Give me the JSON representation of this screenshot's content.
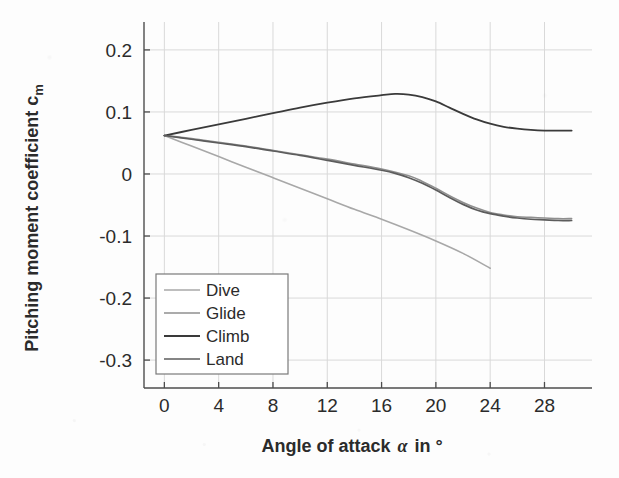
{
  "chart_data": {
    "type": "line",
    "title": "",
    "xlabel": "Angle of attack α in °",
    "ylabel": "Pitching moment coefficient c",
    "ylabel_sub": "m",
    "xlabel_main": "Angle of attack",
    "xlabel_symbol": "α",
    "xlabel_unit": "in °",
    "xlim": [
      -1.5,
      31.5
    ],
    "ylim": [
      -0.345,
      0.245
    ],
    "xticks": [
      0,
      4,
      8,
      12,
      16,
      20,
      24,
      28
    ],
    "xticklabels": [
      "0",
      "4",
      "8",
      "12",
      "16",
      "20",
      "24",
      "28"
    ],
    "yticks": [
      0.2,
      0.1,
      0,
      -0.1,
      -0.2,
      -0.3
    ],
    "yticklabels": [
      "0.2",
      "0.1",
      "0",
      "-0.1",
      "-0.2",
      "-0.3"
    ],
    "grid": true,
    "grid_color": "#d9d9d9",
    "axis_color": "#4d4d4d",
    "legend_position": "lower-left",
    "series": [
      {
        "name": "Dive",
        "color": "#a8a8a8",
        "width": 1.6,
        "x": [
          0,
          2,
          4,
          6,
          8,
          10,
          12,
          14,
          16,
          18,
          20,
          22,
          24
        ],
        "y": [
          0.062,
          0.045,
          0.028,
          0.011,
          -0.006,
          -0.023,
          -0.04,
          -0.057,
          -0.073,
          -0.09,
          -0.108,
          -0.128,
          -0.152
        ]
      },
      {
        "name": "Glide",
        "color": "#8f8f8f",
        "width": 1.6,
        "x": [
          0,
          2,
          4,
          6,
          8,
          10,
          12,
          14,
          16,
          18,
          19,
          20,
          21,
          22,
          23,
          24,
          25,
          26,
          27,
          28,
          29,
          30
        ],
        "y": [
          0.062,
          0.057,
          0.051,
          0.045,
          0.038,
          0.031,
          0.024,
          0.016,
          0.008,
          -0.003,
          -0.012,
          -0.023,
          -0.035,
          -0.046,
          -0.055,
          -0.062,
          -0.066,
          -0.069,
          -0.07,
          -0.071,
          -0.072,
          -0.072
        ]
      },
      {
        "name": "Climb",
        "color": "#3a3a3a",
        "width": 1.8,
        "x": [
          0,
          2,
          4,
          6,
          8,
          10,
          12,
          14,
          16,
          17,
          18,
          19,
          20,
          21,
          22,
          23,
          24,
          25,
          26,
          27,
          28,
          29,
          30
        ],
        "y": [
          0.062,
          0.071,
          0.08,
          0.089,
          0.098,
          0.107,
          0.115,
          0.122,
          0.127,
          0.129,
          0.128,
          0.124,
          0.117,
          0.107,
          0.097,
          0.088,
          0.081,
          0.076,
          0.073,
          0.071,
          0.07,
          0.07,
          0.07
        ]
      },
      {
        "name": "Land",
        "color": "#5c5c5c",
        "width": 1.7,
        "x": [
          0,
          2,
          4,
          6,
          8,
          10,
          12,
          14,
          16,
          17,
          18,
          19,
          20,
          21,
          22,
          23,
          24,
          25,
          26,
          27,
          28,
          29,
          30
        ],
        "y": [
          0.062,
          0.056,
          0.05,
          0.044,
          0.037,
          0.03,
          0.022,
          0.014,
          0.006,
          0.001,
          -0.006,
          -0.015,
          -0.026,
          -0.038,
          -0.049,
          -0.058,
          -0.064,
          -0.068,
          -0.071,
          -0.073,
          -0.074,
          -0.075,
          -0.075
        ]
      }
    ]
  },
  "legend": {
    "entries": [
      "Dive",
      "Glide",
      "Climb",
      "Land"
    ],
    "border_color": "#7a7a7a",
    "background": "#ffffff"
  }
}
